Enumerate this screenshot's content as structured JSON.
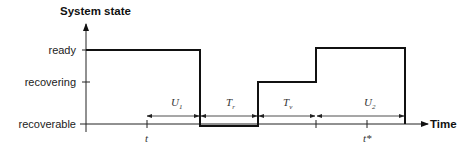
{
  "diagram": {
    "y_axis_title": "System state",
    "x_axis_title": "Time",
    "states": [
      "ready",
      "recovering",
      "recoverable"
    ],
    "time_marks": {
      "t": "t",
      "t_star": "t*"
    },
    "intervals": [
      {
        "label": "U",
        "sub": "1",
        "desc": "ready period before failure"
      },
      {
        "label": "T",
        "sub": "r",
        "desc": "recoverable (down) period"
      },
      {
        "label": "T",
        "sub": "v",
        "desc": "recovering period"
      },
      {
        "label": "U",
        "sub": "2",
        "desc": "ready period after recovery"
      }
    ],
    "colors": {
      "line": "#111111",
      "axis": "#222222"
    }
  }
}
